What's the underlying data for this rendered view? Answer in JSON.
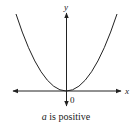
{
  "diagram": {
    "type": "parabola-graph",
    "axes": {
      "x_label": "x",
      "y_label": "y",
      "origin_label": "0"
    },
    "curve": {
      "description": "upward-opening parabola with vertex at origin",
      "vertex": [
        0,
        0
      ]
    },
    "caption": {
      "variable": "a",
      "text": " is positive"
    },
    "colors": {
      "line": "#222222",
      "background": "#ffffff"
    }
  }
}
